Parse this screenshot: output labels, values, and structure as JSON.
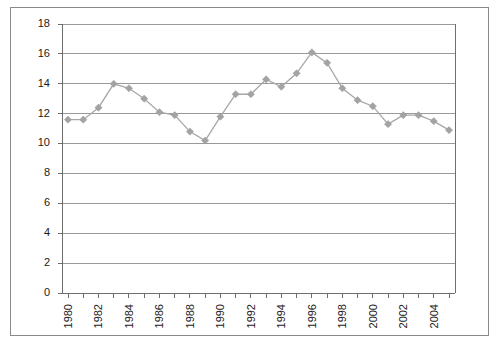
{
  "chart_data": {
    "type": "line",
    "title": "",
    "xlabel": "",
    "ylabel": "",
    "x": [
      1980,
      1981,
      1982,
      1983,
      1984,
      1985,
      1986,
      1987,
      1988,
      1989,
      1990,
      1991,
      1992,
      1993,
      1994,
      1995,
      1996,
      1997,
      1998,
      1999,
      2000,
      2001,
      2002,
      2003,
      2004,
      2005
    ],
    "values": [
      11.6,
      11.6,
      12.4,
      14.0,
      13.7,
      13.0,
      12.1,
      11.9,
      10.8,
      10.2,
      11.8,
      13.3,
      13.3,
      14.3,
      13.8,
      14.7,
      16.1,
      15.4,
      13.7,
      12.9,
      12.5,
      11.3,
      11.9,
      11.9,
      11.5,
      10.9
    ],
    "series": [
      {
        "name": "series-1",
        "color": "#a3a3a3",
        "marker": "diamond",
        "values": [
          11.6,
          11.6,
          12.4,
          14.0,
          13.7,
          13.0,
          12.1,
          11.9,
          10.8,
          10.2,
          11.8,
          13.3,
          13.3,
          14.3,
          13.8,
          14.7,
          16.1,
          15.4,
          13.7,
          12.9,
          12.5,
          11.3,
          11.9,
          11.9,
          11.5,
          10.9
        ]
      }
    ],
    "ylim": [
      0,
      18
    ],
    "yticks": [
      0,
      2,
      4,
      6,
      8,
      10,
      12,
      14,
      16,
      18
    ],
    "ytick_labels": [
      "0",
      "2",
      "4",
      "6",
      "8",
      "10",
      "12",
      "14",
      "16",
      "18"
    ],
    "xtick_labels": [
      "1980",
      "1982",
      "1984",
      "1986",
      "1988",
      "1990",
      "1992",
      "1994",
      "1996",
      "1998",
      "2000",
      "2002",
      "2004"
    ],
    "xtick_values": [
      1980,
      1982,
      1984,
      1986,
      1988,
      1990,
      1992,
      1994,
      1996,
      1998,
      2000,
      2002,
      2004
    ],
    "xtick_rotation": 90,
    "grid": "horizontal",
    "legend": "none",
    "colors": {
      "line": "#a3a3a3",
      "marker": "#a3a3a3",
      "gridline": "#9a9a9a",
      "axis": "#6e6e6e",
      "frame": "#8a8a8a",
      "text": "#1a1a1a",
      "background": "#ffffff"
    }
  }
}
